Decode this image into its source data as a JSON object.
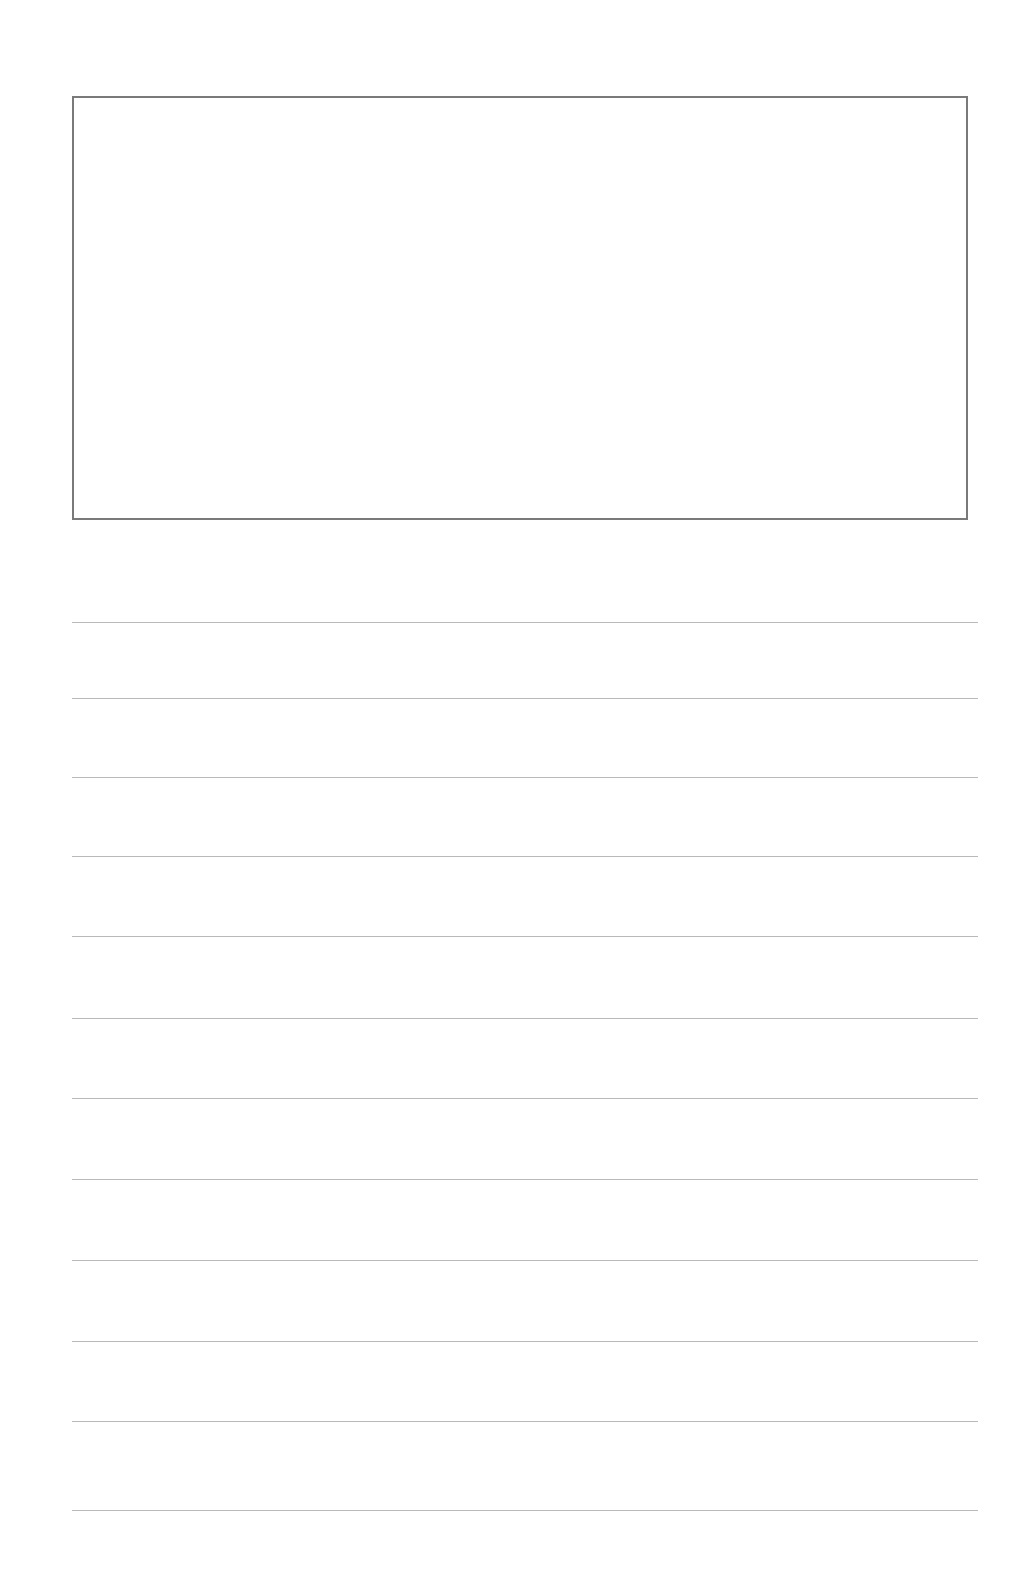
{
  "page": {
    "type": "writing-paper-template",
    "background_color": "#ffffff"
  },
  "drawing_box": {
    "border_color": "#7a7a7a",
    "content": ""
  },
  "writing_lines": {
    "count": 12,
    "line_color": "#b9b9b9",
    "positions_y": [
      622,
      698,
      777,
      856,
      936,
      1018,
      1098,
      1179,
      1260,
      1341,
      1421,
      1510
    ],
    "content": [
      "",
      "",
      "",
      "",
      "",
      "",
      "",
      "",
      "",
      "",
      "",
      ""
    ]
  }
}
